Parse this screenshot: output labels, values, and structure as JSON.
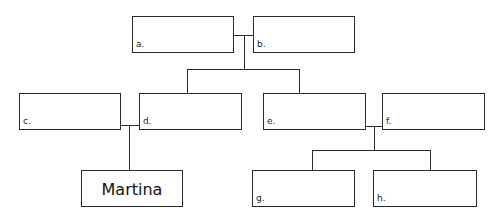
{
  "diagram": {
    "type": "family-tree",
    "boxes": {
      "a": {
        "label": "a.",
        "name": ""
      },
      "b": {
        "label": "b.",
        "name": ""
      },
      "c": {
        "label": "c.",
        "name": ""
      },
      "d": {
        "label": "d.",
        "name": ""
      },
      "e": {
        "label": "e.",
        "name": ""
      },
      "f": {
        "label": "f.",
        "name": ""
      },
      "g": {
        "label": "g.",
        "name": ""
      },
      "h": {
        "label": "h.",
        "name": ""
      },
      "martina": {
        "label": "",
        "name": "Martina"
      }
    }
  }
}
